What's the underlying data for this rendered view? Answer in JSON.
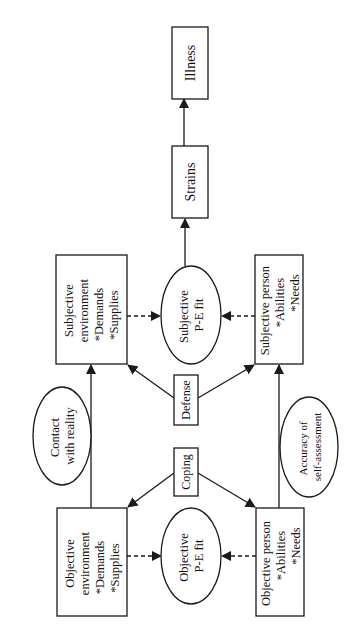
{
  "diagram": {
    "orientation": "rotated 90° counter-clockwise",
    "colors": {
      "stroke": "#1a1a1a",
      "text": "#111111",
      "background": "#ffffff"
    },
    "nodes": {
      "illness": {
        "shape": "rect",
        "lines": [
          "Illness"
        ]
      },
      "strains": {
        "shape": "rect",
        "lines": [
          "Strains"
        ]
      },
      "subjective_environment": {
        "shape": "rect",
        "lines": [
          "Subjective",
          "environment",
          "*Demands",
          "*Supplies"
        ]
      },
      "subjective_pe_fit": {
        "shape": "ellipse",
        "lines": [
          "Subjective",
          "P-E fit"
        ]
      },
      "subjective_person": {
        "shape": "rect",
        "lines": [
          "Subjective person",
          "*Abilities",
          "*Needs"
        ]
      },
      "defense": {
        "shape": "rect",
        "lines": [
          "Defense"
        ]
      },
      "contact_with_reality": {
        "shape": "ellipse",
        "lines": [
          "Contact",
          "with reality"
        ]
      },
      "accuracy_self_assessment": {
        "shape": "ellipse",
        "lines": [
          "Accuracy of",
          "self-assessment"
        ]
      },
      "coping": {
        "shape": "rect",
        "lines": [
          "Coping"
        ]
      },
      "objective_environment": {
        "shape": "rect",
        "lines": [
          "Objective",
          "environment",
          "*Demands",
          "*Supplies"
        ]
      },
      "objective_pe_fit": {
        "shape": "ellipse",
        "lines": [
          "Objective",
          "P-E fit"
        ]
      },
      "objective_person": {
        "shape": "rect",
        "lines": [
          "Objective person",
          "*Abilities",
          "*Needs"
        ]
      }
    },
    "edges": [
      {
        "from": "strains",
        "to": "illness",
        "style": "solid"
      },
      {
        "from": "subjective_pe_fit",
        "to": "strains",
        "style": "solid"
      },
      {
        "from": "subjective_environment",
        "to": "subjective_pe_fit",
        "style": "dashed"
      },
      {
        "from": "subjective_person",
        "to": "subjective_pe_fit",
        "style": "dashed"
      },
      {
        "from": "defense",
        "to": "subjective_environment",
        "style": "solid"
      },
      {
        "from": "defense",
        "to": "subjective_person",
        "style": "solid"
      },
      {
        "from": "objective_environment",
        "to": "subjective_environment",
        "style": "solid",
        "label": "contact_with_reality"
      },
      {
        "from": "objective_person",
        "to": "subjective_person",
        "style": "solid",
        "label": "accuracy_self_assessment"
      },
      {
        "from": "coping",
        "to": "objective_environment",
        "style": "solid"
      },
      {
        "from": "coping",
        "to": "objective_person",
        "style": "solid"
      },
      {
        "from": "objective_environment",
        "to": "objective_pe_fit",
        "style": "dashed"
      },
      {
        "from": "objective_person",
        "to": "objective_pe_fit",
        "style": "dashed"
      }
    ]
  }
}
